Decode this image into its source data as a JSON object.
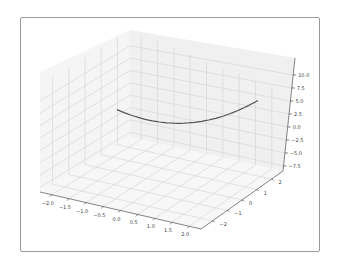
{
  "chart_data": {
    "type": "line",
    "projection": "3d",
    "title": "",
    "xlabel": "",
    "ylabel": "",
    "zlabel": "",
    "x_ticks": [
      "−2.0",
      "−1.5",
      "−1.0",
      "−0.5",
      "0.0",
      "0.5",
      "1.0",
      "1.5",
      "2.0"
    ],
    "y_ticks": [
      "−2",
      "−1",
      "0",
      "1",
      "2"
    ],
    "z_ticks": [
      "10.0",
      "7.5",
      "5.0",
      "2.5",
      "0.0",
      "−2.5",
      "−5.0",
      "−7.5"
    ],
    "xlim": [
      -2.2,
      2.2
    ],
    "ylim": [
      -2.5,
      2.5
    ],
    "zlim": [
      -8.5,
      11.5
    ],
    "grid": true,
    "legend": null,
    "series": [
      {
        "name": "curve",
        "color": "#555555",
        "description": "parabola-like 3D curve z ≈ x^2 + c along x from -2 to 2",
        "x": [
          -2.0,
          -1.5,
          -1.0,
          -0.5,
          0.0,
          0.5,
          1.0,
          1.5,
          2.0
        ],
        "y": [
          0,
          0,
          0,
          0,
          0,
          0,
          0,
          0,
          0
        ],
        "z": [
          4.0,
          2.25,
          1.0,
          0.25,
          0.0,
          0.25,
          1.0,
          2.25,
          4.0
        ]
      }
    ]
  },
  "colors": {
    "pane": "#f2f2f2",
    "grid": "#d0d0d0",
    "axis": "#333333",
    "curve": "#555555",
    "frame": "#9a9a9a"
  }
}
